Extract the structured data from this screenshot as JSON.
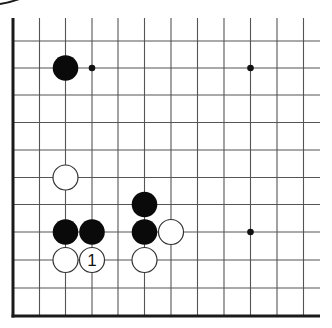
{
  "diagram": {
    "type": "go-board-fragment",
    "visible_edges": [
      "left",
      "bottom"
    ],
    "grid": {
      "columns_x": [
        13,
        39.5,
        65.5,
        92,
        118,
        144.5,
        171,
        197.5,
        224,
        250.5,
        277,
        303.5
      ],
      "rows_y": [
        41,
        68,
        95,
        122.5,
        150,
        177.5,
        204.5,
        232,
        260,
        288,
        316
      ],
      "line_top_y": 18,
      "line_right_x": 320,
      "edge_left_x": 13,
      "edge_bottom_y": 316
    },
    "colors": {
      "line": "#555555",
      "edge": "#1a1a1a",
      "black_stone": "#0a0a0a",
      "white_stone_fill": "#ffffff",
      "white_stone_stroke": "#333333",
      "hoshi": "#111111"
    },
    "stone_radius": 12.5,
    "hoshi": [
      {
        "col": 3,
        "row": 1
      },
      {
        "col": 9,
        "row": 1
      },
      {
        "col": 9,
        "row": 7
      }
    ],
    "stones": [
      {
        "color": "black",
        "col": 2,
        "row": 1,
        "label": ""
      },
      {
        "color": "white",
        "col": 2,
        "row": 5,
        "label": ""
      },
      {
        "color": "black",
        "col": 5,
        "row": 6,
        "label": ""
      },
      {
        "color": "black",
        "col": 2,
        "row": 7,
        "label": ""
      },
      {
        "color": "black",
        "col": 3,
        "row": 7,
        "label": ""
      },
      {
        "color": "black",
        "col": 5,
        "row": 7,
        "label": ""
      },
      {
        "color": "white",
        "col": 6,
        "row": 7,
        "label": ""
      },
      {
        "color": "white",
        "col": 2,
        "row": 8,
        "label": ""
      },
      {
        "color": "white",
        "col": 3,
        "row": 8,
        "label": "1"
      },
      {
        "color": "white",
        "col": 5,
        "row": 8,
        "label": ""
      }
    ]
  }
}
